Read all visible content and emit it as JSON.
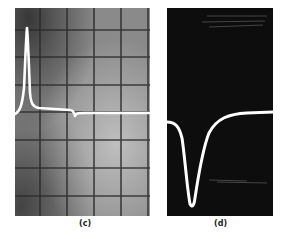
{
  "figure": {
    "panels": [
      {
        "id": "c",
        "label": "(c)",
        "description": "Oscilloscope trace on light gridded screen: sharp positive spike at left, then baseline with small step down",
        "background": "#8a8a8a",
        "trace_color": "#ffffff",
        "grid_color": "#2a2a2a"
      },
      {
        "id": "d",
        "label": "(d)",
        "description": "Oscilloscope trace on dark screen: deep negative dip at left recovering to flat baseline",
        "background": "#0d0d0d",
        "trace_color": "#ffffff"
      }
    ]
  }
}
